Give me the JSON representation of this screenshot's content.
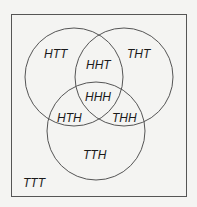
{
  "diagram": {
    "type": "venn-3",
    "colors": {
      "background": "#f4f4f2",
      "stroke": "#555555",
      "text": "#1a1a1a"
    },
    "regions": {
      "htt": "HTT",
      "tht": "THT",
      "hht": "HHT",
      "hhh": "HHH",
      "hth": "HTH",
      "thh": "THH",
      "tth": "TTH",
      "ttt": "TTT"
    }
  }
}
